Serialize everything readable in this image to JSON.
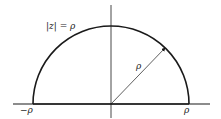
{
  "diagram": {
    "type": "semicircle-contour",
    "labels": {
      "circle": "|z| = ρ",
      "negative_endpoint": "−ρ",
      "positive_endpoint": "ρ",
      "radius": "ρ"
    },
    "colors": {
      "stroke": "#1a1a1a",
      "background": "#ffffff"
    }
  }
}
